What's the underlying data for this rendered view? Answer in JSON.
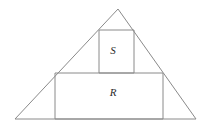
{
  "figure": {
    "name": "triangle-with-inscribed-square-and-rectangle",
    "background_color": "#ffffff",
    "stroke_color": "#8a8a8a",
    "label_color": "#2b2b2b",
    "stroke_width": 1,
    "canvas": {
      "width": 203,
      "height": 127
    },
    "triangle": {
      "name": "outer-triangle",
      "points": "118,9 196,119 15,119",
      "vertices": {
        "apex": {
          "x": 118,
          "y": 9
        },
        "bottom_left": {
          "x": 15,
          "y": 119
        },
        "bottom_right": {
          "x": 196,
          "y": 119
        }
      }
    },
    "square": {
      "name": "square-S",
      "label": "S",
      "x": 99,
      "y": 30,
      "width": 35,
      "height": 43,
      "label_x": 113,
      "label_y": 51
    },
    "rectangle": {
      "name": "rectangle-R",
      "label": "R",
      "x": 55,
      "y": 73,
      "width": 108,
      "height": 46,
      "label_x": 113,
      "label_y": 93
    }
  }
}
